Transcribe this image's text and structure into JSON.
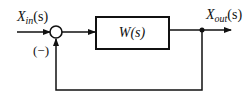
{
  "diagram": {
    "type": "feedback-control-block-diagram",
    "input_label": {
      "main": "X",
      "sub": "in",
      "arg": "(s)"
    },
    "output_label": {
      "main": "X",
      "sub": "out",
      "arg": "(s)"
    },
    "block_label": "W(s)",
    "feedback_sign": "(−)",
    "colors": {
      "line": "#111111",
      "background": "#ffffff"
    }
  }
}
